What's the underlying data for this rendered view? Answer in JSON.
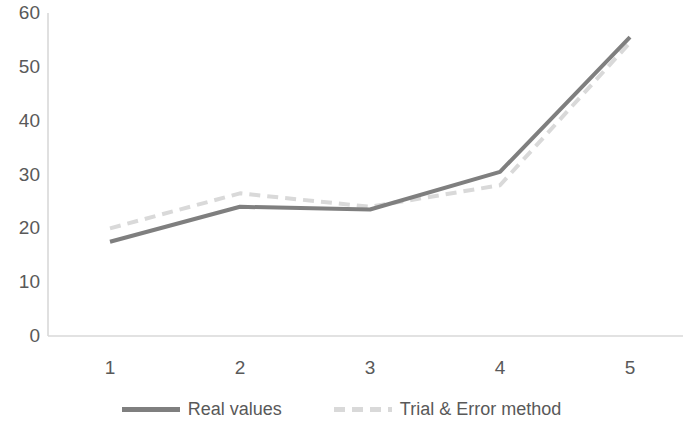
{
  "chart_data": {
    "type": "line",
    "title": "",
    "subtitle": "",
    "xlabel": "",
    "ylabel": "",
    "categories": [
      "1",
      "2",
      "3",
      "4",
      "5"
    ],
    "x": [
      1,
      2,
      3,
      4,
      5
    ],
    "series": [
      {
        "name": "Real values",
        "values": [
          17.5,
          24,
          23.5,
          30.5,
          55.5
        ],
        "color": "#7f7f7f",
        "style": "solid",
        "width": 4
      },
      {
        "name": "Trial & Error method",
        "values": [
          20,
          26.5,
          24,
          28,
          54.5
        ],
        "color": "#d9d9d9",
        "style": "dashed",
        "width": 4
      }
    ],
    "ylim": [
      0,
      60
    ],
    "yticks": [
      0,
      10,
      20,
      30,
      40,
      50,
      60
    ],
    "ytick_labels": [
      "0",
      "10",
      "20",
      "30",
      "40",
      "50",
      "60"
    ],
    "xtick_labels": [
      "1",
      "2",
      "3",
      "4",
      "5"
    ],
    "grid": false,
    "legend_position": "bottom",
    "axis_color": "#d9d9d9",
    "text_color": "#595959",
    "background": "#ffffff"
  },
  "legend": {
    "entries": [
      {
        "label": "Real values",
        "swatch": "solid-line-swatch"
      },
      {
        "label": "Trial & Error method",
        "swatch": "dashed-line-swatch"
      }
    ]
  }
}
